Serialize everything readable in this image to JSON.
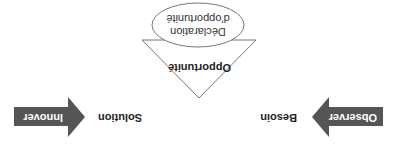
{
  "diagram": {
    "orientation": "rotated-180",
    "triangle": {
      "top_label": "Opportunité",
      "left_label": "Besoin",
      "right_label": "Solution"
    },
    "oval": {
      "line1": "Déclaration",
      "line2": "d'opportunité"
    },
    "arrows": {
      "left": {
        "label": "Observer",
        "direction": "right"
      },
      "right": {
        "label": "Innover",
        "direction": "left"
      }
    },
    "colors": {
      "arrow_fill": "#555555",
      "line": "#777777",
      "text": "#222222"
    }
  }
}
